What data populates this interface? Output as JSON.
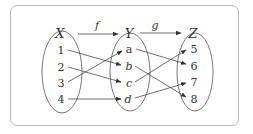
{
  "diagram": {
    "type": "function-composition-mapping",
    "colors": {
      "stroke": "#333333",
      "frame": "#b8b8b8",
      "background": "#ffffff"
    },
    "sets": [
      {
        "name": "X",
        "elements": [
          "1",
          "2",
          "3",
          "4"
        ],
        "italic_elements": false
      },
      {
        "name": "Y",
        "elements": [
          "a",
          "b",
          "c",
          "d"
        ],
        "italic_elements": [
          false,
          true,
          true,
          true
        ]
      },
      {
        "name": "Z",
        "elements": [
          "5",
          "6",
          "7",
          "8"
        ],
        "italic_elements": false
      }
    ],
    "functions": [
      {
        "name": "f",
        "from": "X",
        "to": "Y",
        "mapping": [
          [
            "1",
            "b"
          ],
          [
            "2",
            "c"
          ],
          [
            "3",
            "a"
          ],
          [
            "4",
            "d"
          ]
        ]
      },
      {
        "name": "g",
        "from": "Y",
        "to": "Z",
        "mapping": [
          [
            "a",
            "6"
          ],
          [
            "b",
            "8"
          ],
          [
            "c",
            "5"
          ],
          [
            "d",
            "7"
          ]
        ]
      }
    ]
  },
  "labels": {
    "X": "X",
    "Y": "Y",
    "Z": "Z",
    "f": "f",
    "g": "g",
    "x1": "1",
    "x2": "2",
    "x3": "3",
    "x4": "4",
    "ya": "a",
    "yb": "b",
    "yc": "c",
    "yd": "d",
    "z5": "5",
    "z6": "6",
    "z7": "7",
    "z8": "8"
  }
}
